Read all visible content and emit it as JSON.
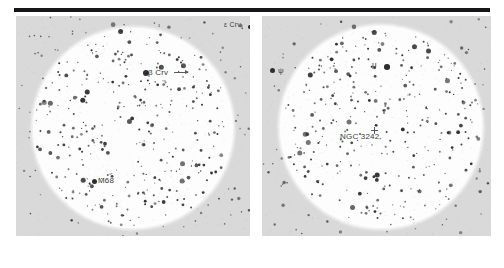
{
  "figure": {
    "kind": "astronomical-star-chart-pair",
    "top_rule": true,
    "background_color": "#ffffff",
    "panel_background_color": "#d9d9d9",
    "sky_disc_color": "#fdfdfd",
    "star_color": "#2e2e30",
    "label_color": "#3a3a3c"
  },
  "panels": [
    {
      "id": "left",
      "name": "left-star-chart",
      "labels": [
        {
          "name": "label-beta-crv",
          "text": "β Crv",
          "marker": true,
          "arrow": true
        },
        {
          "name": "label-epsilon-crv",
          "text": "ε Crv",
          "marker": true,
          "arrow": false
        },
        {
          "name": "label-m68",
          "text": "M68",
          "marker": true,
          "arrow": false
        }
      ]
    },
    {
      "id": "right",
      "name": "right-star-chart",
      "labels": [
        {
          "name": "label-mu",
          "text": "μ",
          "marker": true,
          "arrow": false
        },
        {
          "name": "label-psi",
          "text": "ψ",
          "marker": true,
          "arrow": false
        },
        {
          "name": "label-ngc-3242",
          "text": "NGC 3242",
          "marker": false,
          "arrow": false
        }
      ]
    }
  ],
  "chart_data": {
    "type": "scatter",
    "title": "",
    "xlabel": "",
    "ylabel": "",
    "grid": false,
    "legend": null,
    "fields": [
      {
        "name": "left",
        "disc_center_px": [
          133,
          128
        ],
        "disc_radius_px": 100,
        "annotations": [
          {
            "label": "β Crv",
            "x_px": 143,
            "y_px": 72,
            "magnitude_rank": 1
          },
          {
            "label": "ε Crv",
            "x_px": 248,
            "y_px": 27,
            "magnitude_rank": 3
          },
          {
            "label": "M68",
            "x_px": 92,
            "y_px": 181,
            "magnitude_rank": 2
          }
        ],
        "star_count_estimate": 330
      },
      {
        "name": "right",
        "disc_center_px": [
          381,
          127
        ],
        "disc_radius_px": 101,
        "annotations": [
          {
            "label": "μ",
            "x_px": 385,
            "y_px": 67,
            "magnitude_rank": 2
          },
          {
            "label": "ψ",
            "x_px": 272,
            "y_px": 71,
            "magnitude_rank": 2
          },
          {
            "label": "NGC 3242",
            "x_px": 355,
            "y_px": 132,
            "magnitude_rank": null
          }
        ],
        "star_count_estimate": 320
      }
    ]
  }
}
